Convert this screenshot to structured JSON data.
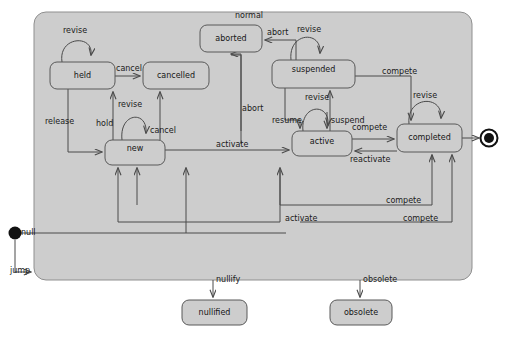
{
  "diagram": {
    "type": "uml-state-machine",
    "title": "",
    "colors": {
      "container_fill": "#cccccc",
      "state_fill": "#cccccc",
      "stroke": "#555555",
      "text": "#151515",
      "node_marker": "#111111",
      "background": "#ffffff"
    },
    "container": {
      "name": "outer-composite-state",
      "x": 34,
      "y": 12,
      "w": 438,
      "h": 268
    },
    "pseudostates": [
      {
        "id": "start",
        "kind": "initial",
        "label": "null",
        "cx": 15,
        "cy": 233,
        "r": 6
      },
      {
        "id": "end",
        "kind": "final",
        "label": "",
        "cx": 489,
        "cy": 135,
        "r": 8
      }
    ],
    "states": [
      {
        "id": "held",
        "label": "held",
        "x": 50,
        "y": 62,
        "w": 65,
        "h": 27
      },
      {
        "id": "cancelled",
        "label": "cancelled",
        "x": 143,
        "y": 62,
        "w": 66,
        "h": 27
      },
      {
        "id": "aborted",
        "label": "aborted",
        "x": 200,
        "y": 25,
        "w": 62,
        "h": 27
      },
      {
        "id": "suspended",
        "label": "suspended",
        "x": 272,
        "y": 60,
        "w": 83,
        "h": 28
      },
      {
        "id": "new",
        "label": "new",
        "x": 105,
        "y": 140,
        "w": 60,
        "h": 25
      },
      {
        "id": "active",
        "label": "active",
        "x": 292,
        "y": 131,
        "w": 60,
        "h": 25
      },
      {
        "id": "completed",
        "label": "completed",
        "x": 397,
        "y": 124,
        "w": 65,
        "h": 28
      },
      {
        "id": "nullified",
        "label": "nullified",
        "x": 182,
        "y": 300,
        "w": 65,
        "h": 25
      },
      {
        "id": "obsolete",
        "label": "obsolete",
        "x": 330,
        "y": 300,
        "w": 62,
        "h": 25
      }
    ],
    "transitions": [
      {
        "id": "t-held-revise",
        "label": "revise",
        "from": "held",
        "to": "held",
        "label_x": 63,
        "label_y": 31
      },
      {
        "id": "t-held-cancelled",
        "label": "cancel",
        "from": "held",
        "to": "cancelled",
        "label_x": 116,
        "label_y": 68
      },
      {
        "id": "t-held-new-release",
        "label": "release",
        "from": "held",
        "to": "new",
        "label_x": 46,
        "label_y": 119
      },
      {
        "id": "t-new-held-hold",
        "label": "hold",
        "from": "new",
        "to": "held",
        "label_x": 101,
        "label_y": 122
      },
      {
        "id": "t-new-revise",
        "label": "revise",
        "from": "new",
        "to": "new",
        "label_x": 122,
        "label_y": 103
      },
      {
        "id": "t-new-cancelled",
        "label": "cancel",
        "from": "new",
        "to": "cancelled",
        "label_x": 150,
        "label_y": 128
      },
      {
        "id": "t-new-active-activate",
        "label": "activate",
        "from": "new",
        "to": "active",
        "label_x": 221,
        "label_y": 142
      },
      {
        "id": "t-aborted-normal",
        "label": "normal",
        "from": "container",
        "to": "aborted",
        "label_x": 237,
        "label_y": 13
      },
      {
        "id": "t-suspended-aborted",
        "label": "abort",
        "from": "suspended",
        "to": "aborted",
        "label_x": 270,
        "label_y": 30
      },
      {
        "id": "t-active-aborted",
        "label": "abort",
        "from": "active",
        "to": "aborted",
        "label_x": 240,
        "label_y": 105
      },
      {
        "id": "t-suspended-revise",
        "label": "revise",
        "from": "suspended",
        "to": "suspended",
        "label_x": 300,
        "label_y": 28
      },
      {
        "id": "t-suspended-resume",
        "label": "resume",
        "from": "suspended",
        "to": "active",
        "label_x": 277,
        "label_y": 119
      },
      {
        "id": "t-active-suspend",
        "label": "suspend",
        "from": "active",
        "to": "suspended",
        "label_x": 333,
        "label_y": 119
      },
      {
        "id": "t-active-revise",
        "label": "revise",
        "from": "active",
        "to": "active",
        "label_x": 309,
        "label_y": 96
      },
      {
        "id": "t-active-completed",
        "label": "compete",
        "from": "active",
        "to": "completed",
        "label_x": 354,
        "label_y": 126
      },
      {
        "id": "t-completed-active",
        "label": "reactivate",
        "from": "completed",
        "to": "active",
        "label_x": 355,
        "label_y": 157
      },
      {
        "id": "t-completed-revise",
        "label": "revise",
        "from": "completed",
        "to": "completed",
        "label_x": 415,
        "label_y": 94
      },
      {
        "id": "t-suspended-completed",
        "label": "compete",
        "from": "suspended",
        "to": "completed",
        "label_x": 384,
        "label_y": 70
      },
      {
        "id": "t-new-completed-compete",
        "label": "compete",
        "from": "new",
        "to": "completed",
        "label_x": 387,
        "label_y": 198
      },
      {
        "id": "t-new-active-activate2",
        "label": "activate",
        "from": "new",
        "to": "active",
        "label_x": 288,
        "label_y": 216
      },
      {
        "id": "t-completed-new-compete",
        "label": "compete",
        "from": "completed",
        "to": "new",
        "label_x": 405,
        "label_y": 216
      },
      {
        "id": "t-start-null",
        "label": "null",
        "from": "start",
        "to": "container",
        "label_x": 22,
        "label_y": 228
      },
      {
        "id": "t-start-jump",
        "label": "jump",
        "from": "start",
        "to": "container",
        "label_x": 13,
        "label_y": 265
      },
      {
        "id": "t-nullify",
        "label": "nullify",
        "from": "container",
        "to": "nullified",
        "label_x": 216,
        "label_y": 277
      },
      {
        "id": "t-obsolete",
        "label": "obsolete",
        "from": "container",
        "to": "obsolete",
        "label_x": 363,
        "label_y": 277
      }
    ]
  }
}
